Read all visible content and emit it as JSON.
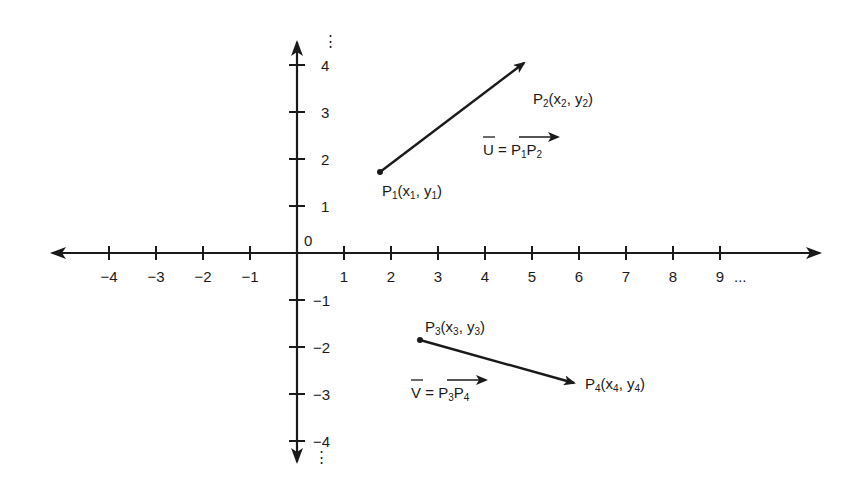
{
  "diagram": {
    "origin_label": "0",
    "x_axis": {
      "ticks": [
        "-4",
        "-3",
        "-2",
        "-1",
        "1",
        "2",
        "3",
        "4",
        "5",
        "6",
        "7",
        "8",
        "9"
      ],
      "continuation": "..."
    },
    "y_axis": {
      "ticks_positive": [
        "1",
        "2",
        "3",
        "4"
      ],
      "ticks_negative": [
        "-1",
        "-2",
        "-3",
        "-4"
      ],
      "continuation": "⋮"
    },
    "vectors": [
      {
        "name": "U",
        "start": {
          "label": "P",
          "sub": "1",
          "coord": "(x",
          "coord_sub_x": "1",
          "sep": ", y",
          "coord_sub_y": "1",
          "close": ")"
        },
        "end": {
          "label": "P",
          "sub": "2",
          "coord": "(x",
          "coord_sub_x": "2",
          "sep": ", y",
          "coord_sub_y": "2",
          "close": ")"
        },
        "equation": {
          "lhs": "U",
          "eq": " = ",
          "p_a": "P",
          "p_a_sub": "1",
          "p_b": "P",
          "p_b_sub": "2"
        }
      },
      {
        "name": "V",
        "start": {
          "label": "P",
          "sub": "3",
          "coord": "(x",
          "coord_sub_x": "3",
          "sep": ", y",
          "coord_sub_y": "3",
          "close": ")"
        },
        "end": {
          "label": "P",
          "sub": "4",
          "coord": "(x",
          "coord_sub_x": "4",
          "sep": ", y",
          "coord_sub_y": "4",
          "close": ")"
        },
        "equation": {
          "lhs": "V",
          "eq": " = ",
          "p_a": "P",
          "p_a_sub": "3",
          "p_b": "P",
          "p_b_sub": "4"
        }
      }
    ],
    "colors": {
      "ink": "#1a1a1a",
      "background": "#ffffff"
    }
  }
}
